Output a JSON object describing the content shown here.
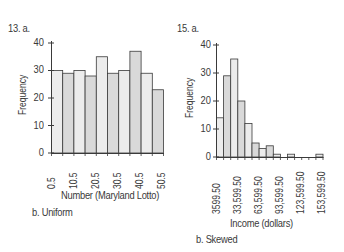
{
  "figure": {
    "left": {
      "problem_label": "13.  a.",
      "ylabel": "Frequency",
      "xlabel": "Number (Maryland Lotto)",
      "caption": "b.  Uniform",
      "yticks": [
        "40",
        "30",
        "20",
        "10",
        "0"
      ],
      "xticks": [
        "0.5",
        "10.5",
        "20.5",
        "30.5",
        "40.5",
        "50.5"
      ]
    },
    "right": {
      "problem_label": "15.  a.",
      "ylabel": "Frequency",
      "xlabel": "Income (dollars)",
      "caption": "b.  Skewed",
      "yticks": [
        "40",
        "30",
        "20",
        "10",
        "0"
      ],
      "xticks": [
        "3599.50",
        "33,599.50",
        "63,599.50",
        "93,599.50",
        "123,599.50",
        "153,599.50"
      ]
    },
    "colors": {
      "bar_light": "#ececec",
      "bar_dark": "#d9d9d9",
      "stroke": "#3a3a3a"
    }
  },
  "chart_data": [
    {
      "type": "bar",
      "title": "13. a.",
      "xlabel": "Number (Maryland Lotto)",
      "ylabel": "Frequency",
      "ylim": [
        0,
        40
      ],
      "bin_edges": [
        0.5,
        5.5,
        10.5,
        15.5,
        20.5,
        25.5,
        30.5,
        35.5,
        40.5,
        45.5,
        50.5
      ],
      "categories": [
        "0.5-5.5",
        "5.5-10.5",
        "10.5-15.5",
        "15.5-20.5",
        "20.5-25.5",
        "25.5-30.5",
        "30.5-35.5",
        "35.5-40.5",
        "40.5-45.5",
        "45.5-50.5"
      ],
      "values": [
        30,
        29,
        30,
        28,
        35,
        29,
        30,
        37,
        29,
        23
      ],
      "xtick_labels": [
        "0.5",
        "10.5",
        "20.5",
        "30.5",
        "40.5",
        "50.5"
      ],
      "ytick_labels": [
        "0",
        "10",
        "20",
        "30",
        "40"
      ],
      "grid": false,
      "annotation": "b. Uniform"
    },
    {
      "type": "bar",
      "title": "15. a.",
      "xlabel": "Income (dollars)",
      "ylabel": "Frequency",
      "ylim": [
        0,
        40
      ],
      "bin_edges": [
        3599.5,
        13599.5,
        23599.5,
        33599.5,
        43599.5,
        53599.5,
        63599.5,
        73599.5,
        83599.5,
        93599.5,
        103599.5,
        113599.5,
        123599.5,
        133599.5,
        143599.5,
        153599.5
      ],
      "categories": [
        "3599.50-13,599.50",
        "13,599.50-23,599.50",
        "23,599.50-33,599.50",
        "33,599.50-43,599.50",
        "43,599.50-53,599.50",
        "53,599.50-63,599.50",
        "63,599.50-73,599.50",
        "73,599.50-83,599.50",
        "83,599.50-93,599.50",
        "93,599.50-103,599.50",
        "103,599.50-113,599.50",
        "113,599.50-123,599.50",
        "123,599.50-133,599.50",
        "133,599.50-143,599.50",
        "143,599.50-153,599.50"
      ],
      "values": [
        14,
        29,
        35,
        20,
        12,
        5,
        3,
        4,
        1,
        0,
        1,
        0,
        0,
        0,
        1
      ],
      "xtick_labels": [
        "3599.50",
        "33,599.50",
        "63,599.50",
        "93,599.50",
        "123,599.50",
        "153,599.50"
      ],
      "ytick_labels": [
        "0",
        "10",
        "20",
        "30",
        "40"
      ],
      "grid": false,
      "annotation": "b. Skewed"
    }
  ]
}
